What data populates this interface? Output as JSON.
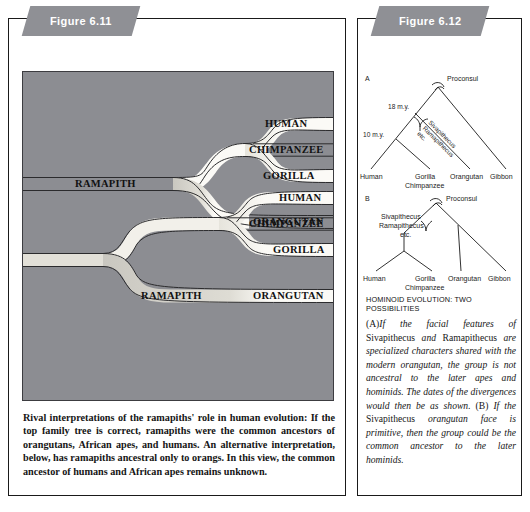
{
  "figures": [
    {
      "tab_label": "Figure 6.11",
      "tree_top": {
        "root_label": "RAMAPITH",
        "tips": [
          "HUMAN",
          "CHIMPANZEE",
          "GORILLA",
          "ORANGUTAN"
        ]
      },
      "tree_bottom": {
        "root_label": "RAMAPITH",
        "tips": [
          "HUMAN",
          "CHIMPANZEE",
          "GORILLA",
          "ORANGUTAN"
        ]
      },
      "caption": "Rival interpretations of the ramapiths' role in human evolution: If the top family tree is correct, ramapiths were the common ancestors of orangutans, African apes, and humans. An alternative interpretation, below, has ramapiths ancestral only to orangs. In this view, the common ancestor of humans and African apes remains unknown."
    },
    {
      "tab_label": "Figure 6.12",
      "heading": "HOMINOID EVOLUTION: TWO POSSIBILITIES",
      "diagram_a": {
        "panel_letter": "A",
        "root_label": "Proconsul",
        "time_labels": [
          "18 m.y.",
          "10 m.y."
        ],
        "clade_label": "Sivapithecus Ramapithecus etc.",
        "clade_label_lines": [
          "Sivapithecus",
          "Ramapithecus",
          "etc."
        ],
        "tips": [
          "Human",
          "Gorilla",
          "Chimpanzee",
          "Orangutan",
          "Gibbon"
        ]
      },
      "diagram_b": {
        "panel_letter": "B",
        "root_label": "Proconsul",
        "clade_label_lines": [
          "Sivapithecus",
          "Ramapithecus",
          "etc."
        ],
        "tips": [
          "Human",
          "Gorilla",
          "Chimpanzee",
          "Orangutan",
          "Gibbon"
        ]
      },
      "caption_parts": {
        "a_marker": "(A)",
        "a_text_1": "If the facial features of ",
        "a_roman_1": "Sivapithecus",
        "a_text_2": " and ",
        "a_roman_2": "Ramapithecus",
        "a_text_3": " are specialized characters shared with the modern orangutan, the group is not ancestral to the later apes and hominids. The dates of the divergences would then be as shown. ",
        "b_marker": "(B)",
        "b_text_1": " If the ",
        "b_roman_1": "Sivapithecus",
        "b_text_2": " orangutan face is primitive, then the group could be the common ancestor to the later hominids."
      }
    }
  ],
  "colors": {
    "tab_gray": "#8f9095",
    "plate_gray": "#8c8d92",
    "branch_light": "#f2f0ea",
    "branch_mid": "#d9d7d0",
    "ink": "#151515"
  }
}
